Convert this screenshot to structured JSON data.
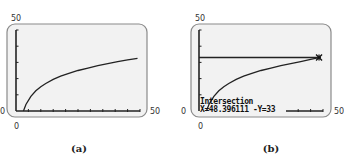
{
  "chart_data": [
    {
      "type": "line",
      "panel": "a",
      "caption": "(a)",
      "title": "",
      "xlabel": "",
      "ylabel": "",
      "xlim": [
        0,
        50
      ],
      "ylim": [
        0,
        50
      ],
      "tick_labels": {
        "x_min": "0",
        "x_max": "50",
        "y_min": "0",
        "y_max": "50"
      },
      "grid": false,
      "x_ticks_count": 10,
      "y_ticks_count": 5,
      "series": [
        {
          "name": "curve",
          "x": [
            3,
            4,
            6,
            8,
            10,
            12,
            15,
            18,
            21,
            25,
            29,
            33,
            37,
            41,
            45,
            49
          ],
          "y": [
            0,
            4,
            9,
            12.5,
            15,
            17,
            19.5,
            21.5,
            23,
            25,
            26.5,
            28,
            29.2,
            30.5,
            31.5,
            32.5
          ]
        }
      ]
    },
    {
      "type": "line",
      "panel": "b",
      "caption": "(b)",
      "title": "",
      "xlabel": "",
      "ylabel": "",
      "xlim": [
        0,
        50
      ],
      "ylim": [
        0,
        50
      ],
      "tick_labels": {
        "x_min": "0",
        "x_max": "50",
        "y_min": "0",
        "y_max": "50"
      },
      "grid": false,
      "series": [
        {
          "name": "curve",
          "x": [
            3,
            4,
            6,
            8,
            10,
            12,
            15,
            18,
            21,
            25,
            29,
            33,
            37,
            41,
            45,
            48.4
          ],
          "y": [
            0,
            4,
            9,
            12.5,
            15,
            17,
            19.5,
            21.5,
            23,
            25,
            26.5,
            28,
            29.2,
            30.5,
            31.8,
            33
          ]
        },
        {
          "name": "horizontal line",
          "x": [
            0,
            50
          ],
          "y": [
            33,
            33
          ]
        }
      ],
      "annotations": [
        {
          "text": "Intersection",
          "x": 48.396111,
          "y": 33
        }
      ],
      "readout": {
        "heading": "Intersection",
        "values": "X=48.396111 -Y=33"
      }
    }
  ],
  "panels": {
    "a": {
      "y_max_label": "50",
      "x_min_label": "0",
      "x_max_label": "50",
      "y_min_label": "0",
      "caption": "(a)"
    },
    "b": {
      "y_max_label": "50",
      "x_min_label": "0",
      "x_max_label": "50",
      "y_min_label": "0",
      "caption": "(b)",
      "readout_heading": "Intersection",
      "readout_values": "X=48.396111 -Y=33"
    }
  },
  "colors": {
    "screen_bg": "#f2f2f2",
    "frame": "#8a8a8a",
    "plot": "#222222"
  }
}
